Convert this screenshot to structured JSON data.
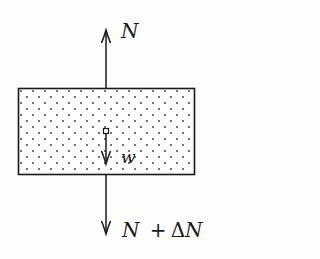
{
  "figure": {
    "type": "free-body diagram",
    "background_color": "#fdfdfc",
    "stroke_color": "#1a1a1a",
    "block": {
      "fill_pattern": "stippled dots",
      "x": 18,
      "y": 88,
      "width": 177,
      "height": 87
    },
    "forces": [
      {
        "id": "top",
        "label": "N",
        "direction": "up"
      },
      {
        "id": "weight",
        "label": "w",
        "direction": "down"
      },
      {
        "id": "bottom",
        "label_parts": [
          "N",
          "+",
          "ΔN"
        ],
        "direction": "down"
      }
    ],
    "labels": {
      "top_force": "N",
      "weight": "w",
      "bottom_force_N": "N",
      "bottom_force_plus": "+",
      "bottom_force_delta": "Δ",
      "bottom_force_N2": "N"
    }
  }
}
